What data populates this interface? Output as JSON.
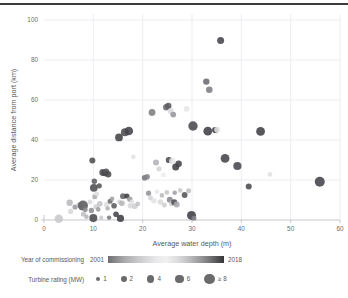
{
  "chart_data": {
    "type": "scatter",
    "title": "",
    "xlabel": "Average water depth (m)",
    "ylabel": "Average distance from port (km)",
    "xlim": [
      0,
      60
    ],
    "ylim": [
      0,
      100
    ],
    "xticks": [
      0,
      10,
      20,
      30,
      40,
      50,
      60
    ],
    "yticks": [
      0,
      20,
      40,
      60,
      80,
      100
    ],
    "grid": true,
    "legend_position": "below",
    "color_encoding": {
      "field": "Year of commissioning",
      "min_label": "2001",
      "max_label": "2018",
      "min_value": 2001,
      "max_value": 2018
    },
    "size_encoding": {
      "field": "Turbine rating (MW)",
      "levels": [
        {
          "label": "1",
          "value": 1,
          "radius_px": 2.1
        },
        {
          "label": "2",
          "value": 2,
          "radius_px": 2.9
        },
        {
          "label": "4",
          "value": 4,
          "radius_px": 3.7
        },
        {
          "label": "6",
          "value": 6,
          "radius_px": 4.4
        },
        {
          "label": "≥ 8",
          "value": 8,
          "radius_px": 5.4
        }
      ]
    },
    "points": [
      {
        "x": 3.0,
        "y": 0.6,
        "r": 4.2,
        "c": "#c8c8cb"
      },
      {
        "x": 5.2,
        "y": 8.6,
        "r": 3.2,
        "c": "#b8b8bb"
      },
      {
        "x": 5.4,
        "y": 4.3,
        "r": 2.6,
        "c": "#d8d8da"
      },
      {
        "x": 6.3,
        "y": 6.5,
        "r": 2.6,
        "c": "#9b9b9e"
      },
      {
        "x": 7.2,
        "y": 7.4,
        "r": 3.0,
        "c": "#bdbdc0"
      },
      {
        "x": 7.9,
        "y": 7.2,
        "r": 5.0,
        "c": "#5a5a5d"
      },
      {
        "x": 8.0,
        "y": 3.0,
        "r": 2.6,
        "c": "#c0c0c3"
      },
      {
        "x": 8.4,
        "y": 5.1,
        "r": 2.4,
        "c": "#8e8e91"
      },
      {
        "x": 8.6,
        "y": 1.6,
        "r": 2.3,
        "c": "#b5b5b8"
      },
      {
        "x": 9.3,
        "y": 9.0,
        "r": 2.4,
        "c": "#dadadc"
      },
      {
        "x": 9.6,
        "y": 4.8,
        "r": 2.6,
        "c": "#8d8d90"
      },
      {
        "x": 9.8,
        "y": 29.7,
        "r": 3.0,
        "c": "#4e4e51"
      },
      {
        "x": 10.0,
        "y": 1.0,
        "r": 4.0,
        "c": "#4a4a4d"
      },
      {
        "x": 10.1,
        "y": 16.1,
        "r": 3.9,
        "c": "#4d4d50"
      },
      {
        "x": 10.2,
        "y": 19.4,
        "r": 2.7,
        "c": "#5e5e61"
      },
      {
        "x": 10.3,
        "y": 11.6,
        "r": 2.5,
        "c": "#acacaf"
      },
      {
        "x": 10.6,
        "y": 6.6,
        "r": 2.6,
        "c": "#cecdd0"
      },
      {
        "x": 10.7,
        "y": 13.0,
        "r": 2.4,
        "c": "#dcdcde"
      },
      {
        "x": 11.0,
        "y": 5.3,
        "r": 2.3,
        "c": "#9d9da0"
      },
      {
        "x": 11.2,
        "y": 17.1,
        "r": 2.6,
        "c": "#58585b"
      },
      {
        "x": 11.3,
        "y": 8.1,
        "r": 2.9,
        "c": "#c5c5c8"
      },
      {
        "x": 11.6,
        "y": 1.1,
        "r": 2.2,
        "c": "#cacacd"
      },
      {
        "x": 11.9,
        "y": 23.8,
        "r": 3.4,
        "c": "#4f4f52"
      },
      {
        "x": 12.3,
        "y": 23.5,
        "r": 3.3,
        "c": "#46464a"
      },
      {
        "x": 12.6,
        "y": 24.2,
        "r": 3.0,
        "c": "#58585b"
      },
      {
        "x": 12.7,
        "y": 7.6,
        "r": 2.9,
        "c": "#dededf"
      },
      {
        "x": 12.9,
        "y": 5.8,
        "r": 2.2,
        "c": "#b1b1b4"
      },
      {
        "x": 13.0,
        "y": 22.9,
        "r": 3.2,
        "c": "#4a4a4d"
      },
      {
        "x": 13.2,
        "y": 1.2,
        "r": 2.2,
        "c": "#78787b"
      },
      {
        "x": 13.4,
        "y": 9.4,
        "r": 2.5,
        "c": "#6c6c6f"
      },
      {
        "x": 13.8,
        "y": 10.6,
        "r": 2.3,
        "c": "#a3a3a6"
      },
      {
        "x": 14.2,
        "y": 7.1,
        "r": 2.8,
        "c": "#5c5c5f"
      },
      {
        "x": 14.6,
        "y": 2.9,
        "r": 2.8,
        "c": "#45454a"
      },
      {
        "x": 15.2,
        "y": 41.3,
        "r": 3.9,
        "c": "#434347"
      },
      {
        "x": 15.3,
        "y": 9.0,
        "r": 2.4,
        "c": "#d2d2d4"
      },
      {
        "x": 15.5,
        "y": 0.8,
        "r": 3.6,
        "c": "#3f3f43"
      },
      {
        "x": 15.8,
        "y": 8.4,
        "r": 2.8,
        "c": "#b6b6b9"
      },
      {
        "x": 16.0,
        "y": 11.9,
        "r": 2.9,
        "c": "#65656a"
      },
      {
        "x": 16.4,
        "y": 43.9,
        "r": 4.0,
        "c": "#4c4c50"
      },
      {
        "x": 16.8,
        "y": 12.0,
        "r": 2.6,
        "c": "#3c3c40"
      },
      {
        "x": 17.2,
        "y": 44.5,
        "r": 4.3,
        "c": "#43434a"
      },
      {
        "x": 17.4,
        "y": 10.4,
        "r": 2.7,
        "c": "#9d9da0"
      },
      {
        "x": 17.5,
        "y": 7.1,
        "r": 2.7,
        "c": "#d7d7d9"
      },
      {
        "x": 17.8,
        "y": 9.0,
        "r": 2.4,
        "c": "#e1e1e3"
      },
      {
        "x": 18.1,
        "y": 31.6,
        "r": 2.4,
        "c": "#e2e2e4"
      },
      {
        "x": 18.4,
        "y": 6.9,
        "r": 2.8,
        "c": "#cfcfd1"
      },
      {
        "x": 19.0,
        "y": 8.0,
        "r": 2.4,
        "c": "#c2c2c5"
      },
      {
        "x": 20.4,
        "y": 21.1,
        "r": 2.8,
        "c": "#737377"
      },
      {
        "x": 20.9,
        "y": 21.6,
        "r": 2.8,
        "c": "#85858a"
      },
      {
        "x": 21.2,
        "y": 13.4,
        "r": 2.6,
        "c": "#949498"
      },
      {
        "x": 21.6,
        "y": 11.0,
        "r": 2.5,
        "c": "#d5d5d7"
      },
      {
        "x": 21.9,
        "y": 53.8,
        "r": 3.4,
        "c": "#7d7d82"
      },
      {
        "x": 22.3,
        "y": 9.6,
        "r": 2.8,
        "c": "#e4e4e5"
      },
      {
        "x": 22.7,
        "y": 28.7,
        "r": 3.0,
        "c": "#b3b3b7"
      },
      {
        "x": 22.9,
        "y": 14.1,
        "r": 2.4,
        "c": "#e8e8e9"
      },
      {
        "x": 23.3,
        "y": 25.6,
        "r": 2.6,
        "c": "#d6d6d8"
      },
      {
        "x": 23.6,
        "y": 9.0,
        "r": 2.8,
        "c": "#dbdbdd"
      },
      {
        "x": 23.9,
        "y": 12.3,
        "r": 2.3,
        "c": "#b9b9bc"
      },
      {
        "x": 24.2,
        "y": 22.6,
        "r": 2.5,
        "c": "#ededee"
      },
      {
        "x": 24.4,
        "y": 7.5,
        "r": 2.5,
        "c": "#d0d0d2"
      },
      {
        "x": 24.8,
        "y": 56.4,
        "r": 3.3,
        "c": "#6a6a6f"
      },
      {
        "x": 24.9,
        "y": 13.8,
        "r": 2.4,
        "c": "#c7c7ca"
      },
      {
        "x": 25.2,
        "y": 57.0,
        "r": 3.2,
        "c": "#5c5c61"
      },
      {
        "x": 25.3,
        "y": 30.0,
        "r": 3.1,
        "c": "#4c4c51"
      },
      {
        "x": 25.5,
        "y": 10.1,
        "r": 3.0,
        "c": "#88888d"
      },
      {
        "x": 25.7,
        "y": 54.5,
        "r": 3.0,
        "c": "#dadadc"
      },
      {
        "x": 25.9,
        "y": 8.3,
        "r": 2.6,
        "c": "#c9c9cc"
      },
      {
        "x": 26.0,
        "y": 29.4,
        "r": 3.2,
        "c": "#e7e7e8"
      },
      {
        "x": 26.2,
        "y": 52.7,
        "r": 2.9,
        "c": "#97979c"
      },
      {
        "x": 26.4,
        "y": 8.9,
        "r": 3.0,
        "c": "#4e4e53"
      },
      {
        "x": 26.5,
        "y": 13.6,
        "r": 2.3,
        "c": "#9fa0a4"
      },
      {
        "x": 26.7,
        "y": 26.5,
        "r": 3.5,
        "c": "#3e3e43"
      },
      {
        "x": 26.9,
        "y": 7.7,
        "r": 3.0,
        "c": "#aaaaae"
      },
      {
        "x": 27.3,
        "y": 28.1,
        "r": 3.2,
        "c": "#43434a"
      },
      {
        "x": 27.6,
        "y": 14.8,
        "r": 2.3,
        "c": "#cacacd"
      },
      {
        "x": 28.5,
        "y": 12.5,
        "r": 2.9,
        "c": "#55555a"
      },
      {
        "x": 28.9,
        "y": 55.6,
        "r": 2.9,
        "c": "#e6e6e7"
      },
      {
        "x": 29.3,
        "y": 14.6,
        "r": 2.5,
        "c": "#c1c1c4"
      },
      {
        "x": 29.9,
        "y": 2.3,
        "r": 4.5,
        "c": "#3e3e43"
      },
      {
        "x": 30.2,
        "y": 47.0,
        "r": 4.7,
        "c": "#49494e"
      },
      {
        "x": 30.4,
        "y": 0.9,
        "r": 2.5,
        "c": "#83838a"
      },
      {
        "x": 32.9,
        "y": 69.2,
        "r": 3.2,
        "c": "#6a6a70"
      },
      {
        "x": 33.2,
        "y": 44.4,
        "r": 4.4,
        "c": "#3f3f45"
      },
      {
        "x": 33.5,
        "y": 65.1,
        "r": 3.3,
        "c": "#7d7d83"
      },
      {
        "x": 34.7,
        "y": 45.0,
        "r": 3.1,
        "c": "#3b3b41"
      },
      {
        "x": 35.1,
        "y": 45.1,
        "r": 3.0,
        "c": "#e3e3e5"
      },
      {
        "x": 35.8,
        "y": 89.8,
        "r": 3.5,
        "c": "#45454b"
      },
      {
        "x": 36.7,
        "y": 30.8,
        "r": 4.4,
        "c": "#44444a"
      },
      {
        "x": 39.2,
        "y": 27.0,
        "r": 4.1,
        "c": "#47474d"
      },
      {
        "x": 41.5,
        "y": 16.8,
        "r": 3.0,
        "c": "#4a4a50"
      },
      {
        "x": 43.9,
        "y": 44.3,
        "r": 4.4,
        "c": "#404046"
      },
      {
        "x": 45.8,
        "y": 22.8,
        "r": 2.4,
        "c": "#e0e0e2"
      },
      {
        "x": 55.9,
        "y": 19.1,
        "r": 5.0,
        "c": "#43434a"
      }
    ]
  },
  "legend": {
    "year": {
      "title": "Year of commissioning",
      "min_label": "2001",
      "max_label": "2018"
    },
    "size": {
      "title": "Turbine rating (MW)",
      "items": [
        "1",
        "2",
        "4",
        "6",
        "≥ 8"
      ]
    }
  },
  "colors": {
    "text": "#58585a",
    "grid": "#e9e9ef",
    "axis": "#b9b9c2",
    "rule": "#3b3b3d"
  }
}
